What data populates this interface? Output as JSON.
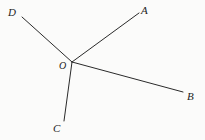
{
  "figure": {
    "type": "geometry-ray-diagram",
    "background_color": "#fbfbfa",
    "stroke_color": "#2a2a2a",
    "stroke_width": 1,
    "vertex": {
      "name": "O",
      "label": "O",
      "x": 72,
      "y": 62
    },
    "rays": [
      {
        "name": "ray-OA",
        "label": "A",
        "from": {
          "x": 72,
          "y": 62
        },
        "to": {
          "x": 139,
          "y": 13
        }
      },
      {
        "name": "ray-OB",
        "label": "B",
        "from": {
          "x": 72,
          "y": 62
        },
        "to": {
          "x": 183,
          "y": 92
        }
      },
      {
        "name": "ray-OC",
        "label": "C",
        "from": {
          "x": 72,
          "y": 62
        },
        "to": {
          "x": 64,
          "y": 121
        }
      },
      {
        "name": "ray-OD",
        "label": "D",
        "from": {
          "x": 72,
          "y": 62
        },
        "to": {
          "x": 22,
          "y": 17
        }
      }
    ],
    "labels": {
      "A": "A",
      "B": "B",
      "C": "C",
      "D": "D",
      "O": "O"
    }
  }
}
